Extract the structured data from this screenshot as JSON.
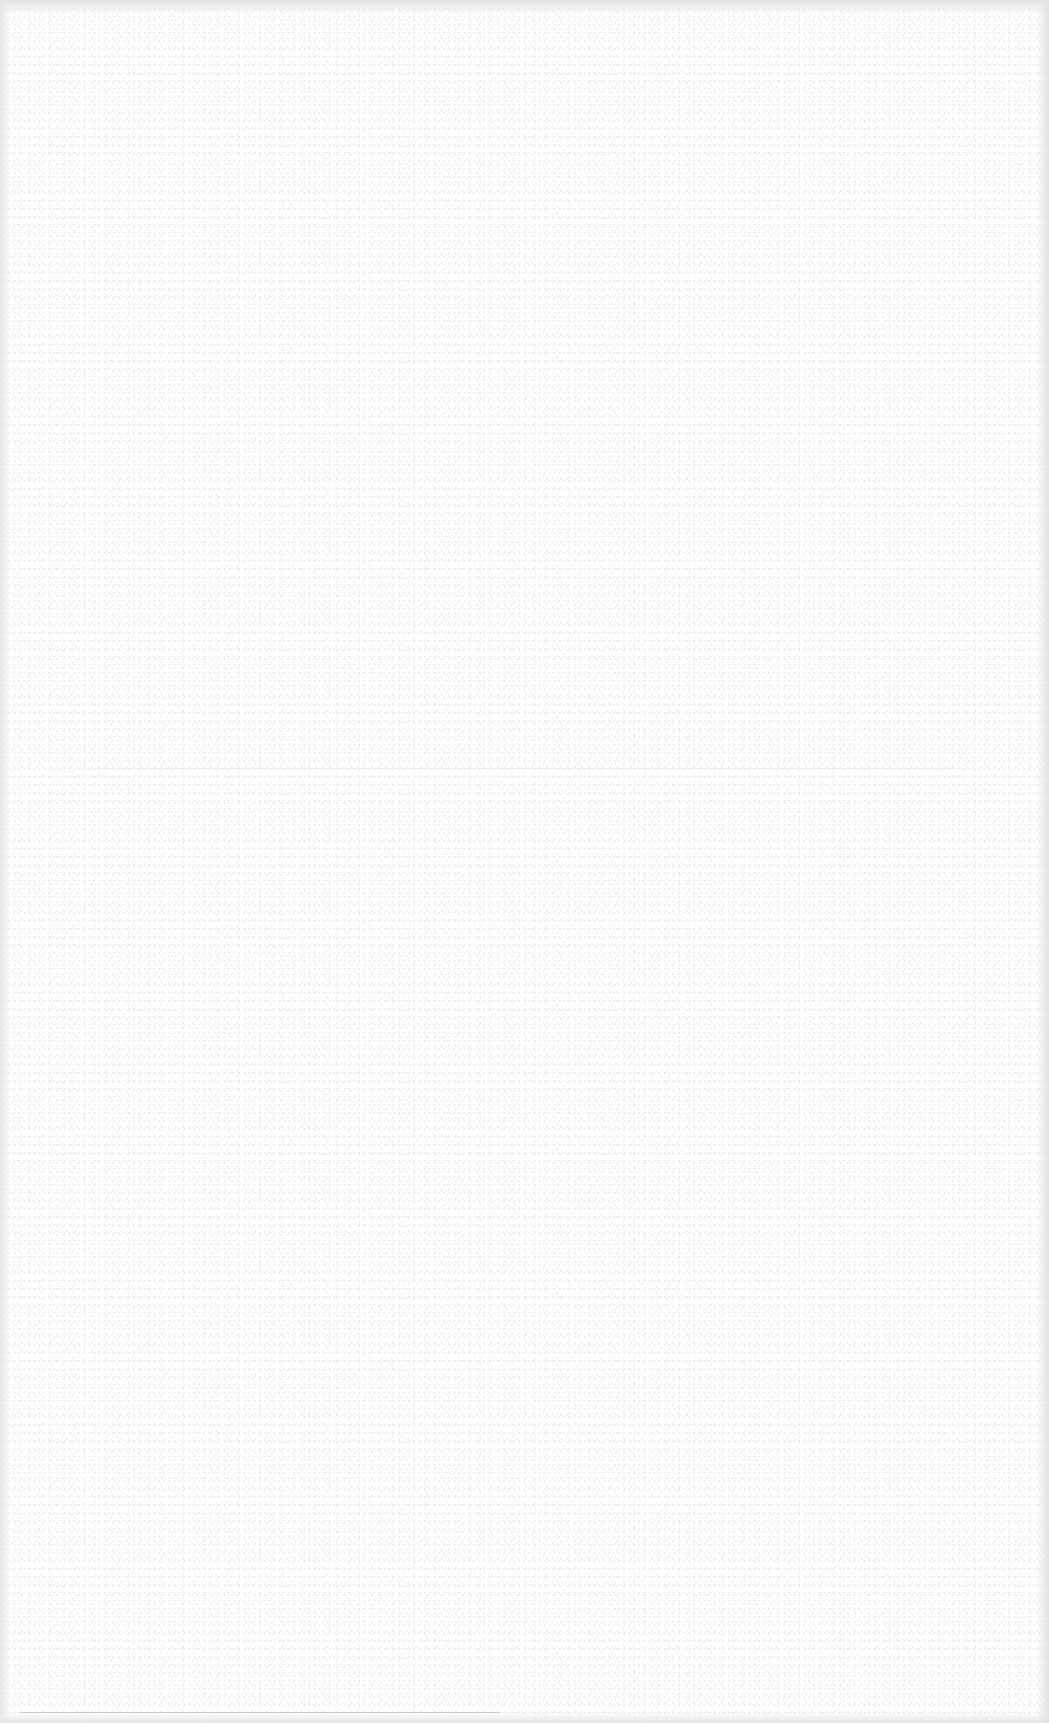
{
  "page": {
    "type": "blank-scanned-page",
    "background_color": "#fdfdfd",
    "text_content": "",
    "elements": [
      {
        "kind": "faint-horizontal-rule",
        "position": "middle",
        "y": 768,
        "color": "#ececec"
      },
      {
        "kind": "faint-horizontal-rule",
        "position": "bottom",
        "y": 1712,
        "color": "#c9c9c9"
      }
    ]
  }
}
